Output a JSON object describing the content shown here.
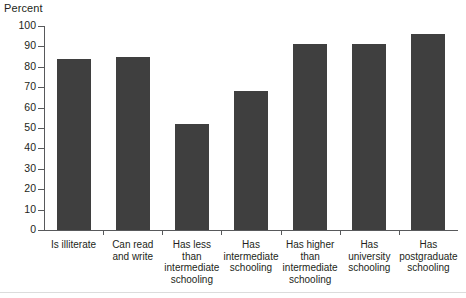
{
  "chart_data": {
    "type": "bar",
    "title": "Percent",
    "xlabel": "",
    "ylabel": "Percent",
    "categories": [
      "Is illiterate",
      "Can read\nand write",
      "Has less\nthan\nintermediate\nschooling",
      "Has\nintermediate\nschooling",
      "Has higher\nthan\nintermediate\nschooling",
      "Has\nuniversity\nschooling",
      "Has\npostgraduate\nschooling"
    ],
    "values": [
      84,
      85,
      52,
      68,
      91,
      91,
      96
    ],
    "ylim": [
      0,
      100
    ],
    "ytick_labels": [
      "0",
      "10",
      "20",
      "30",
      "40",
      "50",
      "60",
      "70",
      "80",
      "90",
      "100"
    ],
    "ytick_values": [
      0,
      10,
      20,
      30,
      40,
      50,
      60,
      70,
      80,
      90,
      100
    ],
    "grid": false,
    "legend": "none",
    "bar_color": "#3f3f3f",
    "axis_color": "#58595b",
    "text_color": "#231f20",
    "background_color": "#ffffff"
  }
}
